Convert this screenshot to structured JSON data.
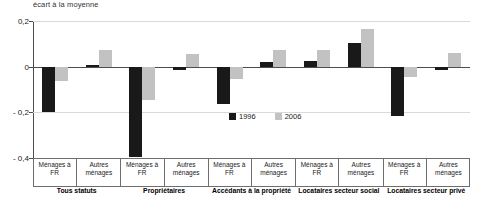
{
  "chart_data": {
    "type": "bar",
    "title": "",
    "subtitle": "",
    "ylabel": "écart à la moyenne",
    "xlabel": "",
    "ylim": [
      -0.4,
      0.2
    ],
    "yticks": [
      0.2,
      0,
      -0.2,
      -0.4
    ],
    "ytick_labels": [
      "0,2",
      "0",
      "- 0,2",
      "- 0,4"
    ],
    "grid": true,
    "legend_position": "inside-bottom-center",
    "categories": [
      "Ménages à FR",
      "Autres ménages",
      "Ménages à FR",
      "Autres ménages",
      "Ménages à FR",
      "Autres ménages",
      "Ménages à FR",
      "Autres ménages",
      "Ménages à FR",
      "Autres ménages"
    ],
    "groups": [
      {
        "name": "Tous statuts",
        "categories": [
          "Ménages à FR",
          "Autres ménages"
        ]
      },
      {
        "name": "Propriétaires",
        "categories": [
          "Ménages à FR",
          "Autres ménages"
        ]
      },
      {
        "name": "Accédants à la propriété",
        "categories": [
          "Ménages à FR",
          "Autres ménages"
        ]
      },
      {
        "name": "Locataires secteur social",
        "categories": [
          "Ménages à FR",
          "Autres ménages"
        ]
      },
      {
        "name": "Locataires secteur privé",
        "categories": [
          "Ménages à FR",
          "Autres ménages"
        ]
      }
    ],
    "series": [
      {
        "name": "1996",
        "color": "#191919",
        "values": [
          -0.2,
          0.006,
          -0.395,
          -0.013,
          -0.165,
          0.022,
          0.025,
          0.105,
          -0.215,
          -0.013
        ]
      },
      {
        "name": "2006",
        "color": "#c2c2c2",
        "values": [
          -0.065,
          0.075,
          -0.145,
          0.055,
          -0.055,
          0.075,
          0.075,
          0.165,
          -0.045,
          0.06
        ]
      }
    ]
  },
  "legend": {
    "entries": [
      {
        "label": "1996",
        "color": "#191919"
      },
      {
        "label": "2006",
        "color": "#c2c2c2"
      }
    ]
  }
}
